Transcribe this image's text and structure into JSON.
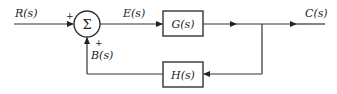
{
  "diagram": {
    "type": "feedback-control-block-diagram",
    "input": "R(s)",
    "output": "C(s)",
    "error": "E(s)",
    "feedback_signal": "B(s)",
    "summing_junction": {
      "symbol": "Σ",
      "input_sign": "+",
      "feedback_sign": "+"
    },
    "blocks": {
      "forward": "G(s)",
      "feedback": "H(s)"
    }
  }
}
